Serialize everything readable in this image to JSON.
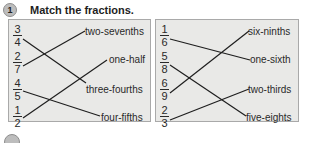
{
  "exercise": {
    "number": "1",
    "title": "Match the fractions."
  },
  "left_panel": {
    "fractions": [
      {
        "num": "3",
        "den": "4"
      },
      {
        "num": "2",
        "den": "7"
      },
      {
        "num": "4",
        "den": "5"
      },
      {
        "num": "1",
        "den": "2"
      }
    ],
    "labels": [
      "two-sevenths",
      "one-half",
      "three-fourths",
      "four-fifths"
    ],
    "matches": [
      {
        "fraction": "3/4",
        "label": "three-fourths"
      },
      {
        "fraction": "2/7",
        "label": "two-sevenths"
      },
      {
        "fraction": "4/5",
        "label": "four-fifths"
      },
      {
        "fraction": "1/2",
        "label": "one-half"
      }
    ]
  },
  "right_panel": {
    "fractions": [
      {
        "num": "1",
        "den": "6"
      },
      {
        "num": "5",
        "den": "8"
      },
      {
        "num": "6",
        "den": "9"
      },
      {
        "num": "2",
        "den": "3"
      }
    ],
    "labels": [
      "six-ninths",
      "one-sixth",
      "two-thirds",
      "five-eights"
    ],
    "matches": [
      {
        "fraction": "1/6",
        "label": "one-sixth"
      },
      {
        "fraction": "5/8",
        "label": "five-eights"
      },
      {
        "fraction": "6/9",
        "label": "six-ninths"
      },
      {
        "fraction": "2/3",
        "label": "two-thirds"
      }
    ]
  },
  "colors": {
    "panel_bg": "#e9e9e7",
    "panel_border": "#a9a9a9",
    "line": "#1e1e1e",
    "badge": "#bdbdbd"
  }
}
